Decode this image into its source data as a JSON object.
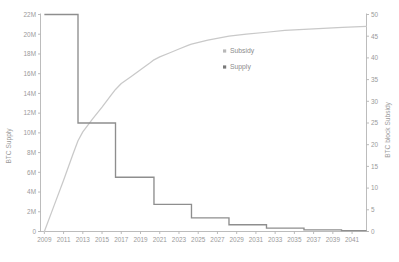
{
  "chart_data": {
    "type": "line",
    "title": "",
    "xlabel": "",
    "ylabel": "BTC Supply",
    "y2label": "BTC block Subsidy",
    "grid": false,
    "legend_position": "center-right-inside",
    "x": [
      2009,
      2011,
      2013,
      2015,
      2017,
      2019,
      2021,
      2023,
      2025,
      2027,
      2029,
      2031,
      2033,
      2035,
      2037,
      2039,
      2041
    ],
    "xlim": [
      2008.6,
      2042.5
    ],
    "xticklabels": [
      "2009",
      "2011",
      "2013",
      "2015",
      "2017",
      "2019",
      "2021",
      "2023",
      "2025",
      "2027",
      "2029",
      "2031",
      "2033",
      "2035",
      "2037",
      "2039",
      "2041"
    ],
    "ylim": [
      0,
      22
    ],
    "yticks": [
      0,
      2,
      4,
      6,
      8,
      10,
      12,
      14,
      16,
      18,
      20,
      22
    ],
    "yticklabels": [
      "0",
      "2M",
      "4M",
      "6M",
      "8M",
      "10M",
      "12M",
      "14M",
      "16M",
      "18M",
      "20M",
      "22M"
    ],
    "y2lim": [
      0,
      50
    ],
    "y2ticks": [
      0,
      5,
      10,
      15,
      20,
      25,
      30,
      35,
      40,
      45,
      50
    ],
    "y2ticklabels": [
      "0",
      "5",
      "10",
      "15",
      "20",
      "25",
      "30",
      "35",
      "40",
      "45",
      "50"
    ],
    "series": [
      {
        "name": "Subsidy",
        "axis": "right",
        "style": "step-post",
        "color": "#8e8e8e",
        "x": [
          2009.0,
          2012.5,
          2016.4,
          2020.4,
          2024.3,
          2028.2,
          2032.1,
          2036.0,
          2039.9,
          2042.5
        ],
        "values": [
          50,
          25,
          12.5,
          6.25,
          3.125,
          1.5625,
          0.78125,
          0.390625,
          0.1953125,
          0.1953125
        ]
      },
      {
        "name": "Supply",
        "axis": "left",
        "style": "line",
        "color": "#c9c9c9",
        "x": [
          2009.0,
          2010.0,
          2011.0,
          2012.0,
          2012.5,
          2013.0,
          2014.0,
          2015.0,
          2016.0,
          2016.4,
          2017.0,
          2018.0,
          2019.0,
          2020.0,
          2020.4,
          2021.0,
          2022.0,
          2023.0,
          2024.0,
          2024.3,
          2026.0,
          2028.2,
          2030.0,
          2032.1,
          2034.0,
          2036.0,
          2038.0,
          2040.0,
          2042.5
        ],
        "values": [
          0.0,
          2.6,
          5.2,
          7.9,
          9.2,
          10.1,
          11.4,
          12.6,
          13.9,
          14.4,
          15.0,
          15.7,
          16.4,
          17.1,
          17.4,
          17.7,
          18.1,
          18.5,
          18.9,
          19.0,
          19.4,
          19.8,
          20.0,
          20.2,
          20.4,
          20.5,
          20.6,
          20.7,
          20.8
        ]
      }
    ]
  },
  "legend": {
    "items": [
      {
        "label": "Subsidy",
        "marker": "square",
        "color": "#b8b8b8"
      },
      {
        "label": "Supply",
        "marker": "square",
        "color": "#7a7a7a"
      }
    ]
  },
  "axes": {
    "left_title": "BTC Supply",
    "right_title": "BTC block Subsidy"
  }
}
